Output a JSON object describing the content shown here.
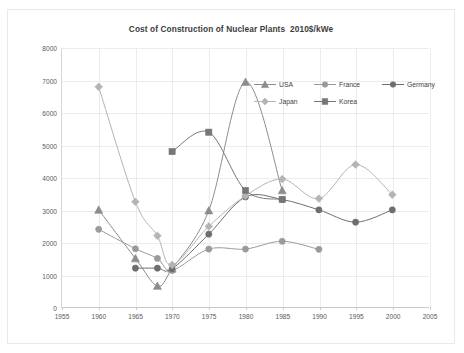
{
  "chart_data": {
    "type": "line",
    "title": "Cost of Construction of Nuclear Plants  2010$/kWe",
    "xlabel": "",
    "ylabel": "",
    "xlim": [
      1955,
      2005
    ],
    "ylim": [
      0,
      8000
    ],
    "xticks": [
      1955,
      1960,
      1965,
      1970,
      1975,
      1980,
      1985,
      1990,
      1995,
      2000,
      2005
    ],
    "yticks": [
      0,
      1000,
      2000,
      3000,
      4000,
      5000,
      6000,
      7000,
      8000
    ],
    "grid": true,
    "legend_position": "upper-right-inside",
    "series": [
      {
        "name": "USA",
        "color": "#8c8c8c",
        "marker": "triangle",
        "x": [
          1960,
          1965,
          1968,
          1970,
          1975,
          1980,
          1985
        ],
        "values": [
          3000,
          1500,
          650,
          1180,
          2980,
          6950,
          3600
        ]
      },
      {
        "name": "France",
        "color": "#9a9a9a",
        "marker": "circle",
        "x": [
          1960,
          1965,
          1968,
          1970,
          1975,
          1980,
          1985,
          1990
        ],
        "values": [
          2400,
          1800,
          1500,
          1130,
          1790,
          1790,
          2030,
          1780
        ]
      },
      {
        "name": "Germany",
        "color": "#6e6e6e",
        "marker": "circle",
        "x": [
          1965,
          1968,
          1970,
          1975,
          1980,
          1985,
          1990,
          1995,
          2000
        ],
        "values": [
          1200,
          1200,
          1180,
          2250,
          3400,
          3320,
          3000,
          2620,
          3000
        ]
      },
      {
        "name": "Japan",
        "color": "#b4b4b4",
        "marker": "diamond",
        "x": [
          1960,
          1965,
          1968,
          1970,
          1975,
          1980,
          1985,
          1990,
          1995,
          2000
        ],
        "values": [
          6800,
          3250,
          2200,
          1300,
          2490,
          3430,
          3950,
          3350,
          4400,
          3470
        ]
      },
      {
        "name": "Korea",
        "color": "#767676",
        "marker": "square",
        "x": [
          1970,
          1975,
          1980,
          1985
        ],
        "values": [
          4800,
          5400,
          3600,
          3320
        ]
      }
    ]
  },
  "legend": {
    "rows": [
      [
        {
          "label": "USA",
          "marker": "triangle",
          "color": "#8c8c8c"
        },
        {
          "label": "France",
          "marker": "circle",
          "color": "#9a9a9a"
        },
        {
          "label": "Germany",
          "marker": "circle",
          "color": "#6e6e6e"
        }
      ],
      [
        {
          "label": "Japan",
          "marker": "diamond",
          "color": "#b4b4b4"
        },
        {
          "label": "Korea",
          "marker": "square",
          "color": "#767676"
        }
      ]
    ]
  }
}
